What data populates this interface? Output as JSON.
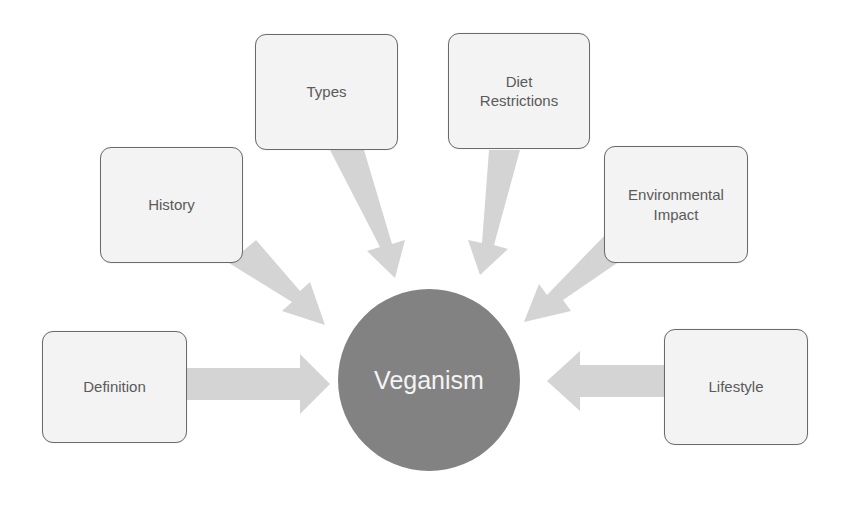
{
  "diagram": {
    "title": "Veganism",
    "type": "radial-hub",
    "center": {
      "label": "Veganism",
      "color": "#828282",
      "text_color": "#f4f4f4"
    },
    "node_style": {
      "fill": "#f3f3f3",
      "stroke": "#6a6a6a",
      "text_color": "#5a5a5a"
    },
    "arrow_color": "#d4d4d4",
    "nodes": [
      {
        "id": "definition",
        "label": "Definition"
      },
      {
        "id": "history",
        "label": "History"
      },
      {
        "id": "types",
        "label": "Types"
      },
      {
        "id": "diet-restrictions",
        "label": "Diet Restrictions"
      },
      {
        "id": "environmental-impact",
        "label": "Environmental Impact"
      },
      {
        "id": "lifestyle",
        "label": "Lifestyle"
      }
    ],
    "edges": [
      {
        "from": "definition",
        "to": "center"
      },
      {
        "from": "history",
        "to": "center"
      },
      {
        "from": "types",
        "to": "center"
      },
      {
        "from": "diet-restrictions",
        "to": "center"
      },
      {
        "from": "environmental-impact",
        "to": "center"
      },
      {
        "from": "lifestyle",
        "to": "center"
      }
    ]
  }
}
